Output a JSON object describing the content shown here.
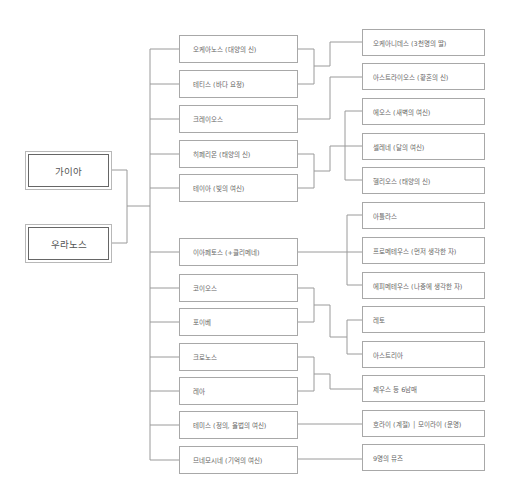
{
  "roots": [
    {
      "label": "가이아"
    },
    {
      "label": "우라노스"
    }
  ],
  "titans": [
    {
      "label": "오케아노스 (대양의 신)"
    },
    {
      "label": "테티스 (바다 요정)"
    },
    {
      "label": "크레이오스"
    },
    {
      "label": "히페리온 (태양의 신)"
    },
    {
      "label": "테이아 (빛의 여신)"
    },
    {
      "label": "이아페토스 (+클리메네)"
    },
    {
      "label": "코이오스"
    },
    {
      "label": "포이베"
    },
    {
      "label": "크로노스"
    },
    {
      "label": "레아"
    },
    {
      "label": "테미스 (정의, 율법의 여신)"
    },
    {
      "label": "므네모시네 (기억의 여신)"
    }
  ],
  "offspring": [
    {
      "label": "오케아니데스 (3천명의 딸)"
    },
    {
      "label": "아스트라이오스 (황혼의 신)"
    },
    {
      "label": "에오스 (새벽의 여신)"
    },
    {
      "label": "셀레네 (달의 여신)"
    },
    {
      "label": "헬리오스 (태양의 신)"
    },
    {
      "label": "아틀라스"
    },
    {
      "label": "프로메테우스 (먼저 생각한 자)"
    },
    {
      "label": "에피메테우스 (나중에 생각한 자)"
    },
    {
      "label": "레토"
    },
    {
      "label": "아스트리아"
    },
    {
      "label": "제우스 등 6남매"
    },
    {
      "label": "호라이 (계절) │ 모이라이 (운명)"
    },
    {
      "label": "9명의 뮤즈"
    }
  ]
}
